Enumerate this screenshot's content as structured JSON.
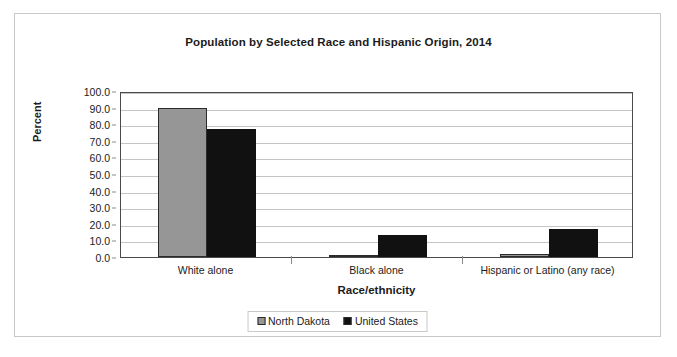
{
  "chart_data": {
    "type": "bar",
    "title": "Population by Selected Race and Hispanic Origin, 2014",
    "xlabel": "Race/ethnicity",
    "ylabel": "Percent",
    "categories": [
      "White alone",
      "Black alone",
      "Hispanic or Latino (any race)"
    ],
    "series": [
      {
        "name": "North Dakota",
        "color": "#969696",
        "values": [
          90.0,
          1.5,
          2.0
        ]
      },
      {
        "name": "United States",
        "color": "#111111",
        "values": [
          77.0,
          13.0,
          17.0
        ]
      }
    ],
    "ylim": [
      0,
      100
    ],
    "ytick_step": 10,
    "ytick_labels": [
      "0.0",
      "10.0",
      "20.0",
      "30.0",
      "40.0",
      "50.0",
      "60.0",
      "70.0",
      "80.0",
      "90.0",
      "100.0"
    ],
    "grid": true,
    "legend_position": "bottom"
  }
}
